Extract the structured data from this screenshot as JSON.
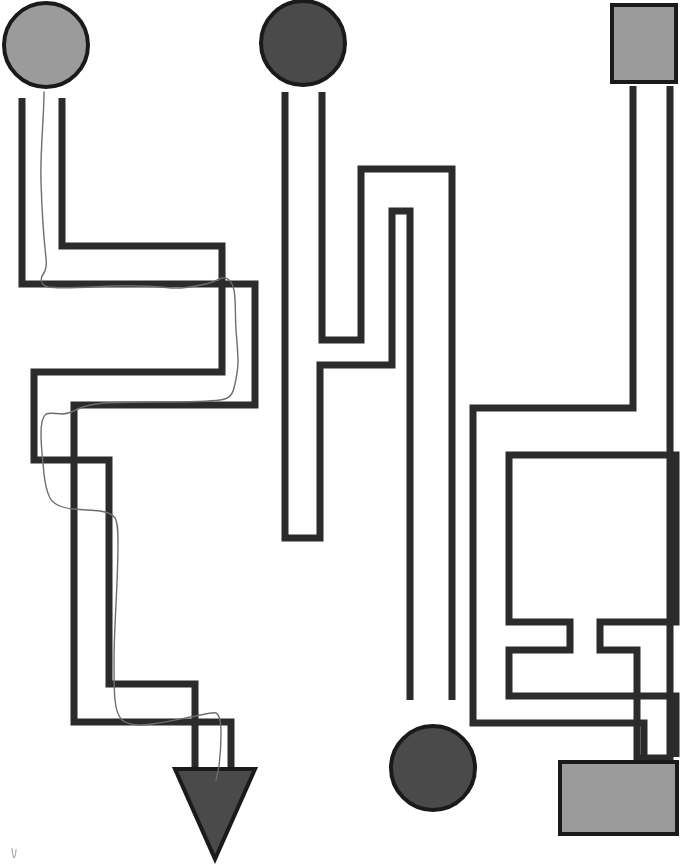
{
  "page": {
    "width": 684,
    "height": 867,
    "background_color": "#ffffff"
  },
  "colors": {
    "wall_stroke": "#2b2b2b",
    "wall_stroke_width": 7,
    "shape_outline": "#1a1a1a",
    "light_gray_fill": "#9b9b9b",
    "dark_gray_fill": "#4a4a4a",
    "pencil_line": "#6e6e6e",
    "paper": "#ffffff"
  },
  "shapes": [
    {
      "name": "start-circle-light",
      "kind": "circle",
      "fill_label": "light gray",
      "fill": "#9b9b9b",
      "cx": 46,
      "cy": 45,
      "r": 42,
      "role": "start marker for left maze"
    },
    {
      "name": "start-circle-dark-top",
      "kind": "circle",
      "fill_label": "dark gray",
      "fill": "#4a4a4a",
      "cx": 303,
      "cy": 43,
      "r": 42,
      "role": "start marker for middle maze"
    },
    {
      "name": "start-square-light",
      "kind": "square",
      "fill_label": "light gray",
      "fill": "#9b9b9b",
      "x": 612,
      "y": 5,
      "width": 64,
      "height": 77,
      "role": "start marker for right maze"
    },
    {
      "name": "end-triangle-dark",
      "kind": "triangle-down",
      "fill_label": "dark gray",
      "fill": "#4a4a4a",
      "x": 175,
      "y": 769,
      "width": 80,
      "height": 90,
      "role": "end marker for left maze"
    },
    {
      "name": "end-circle-dark-bottom",
      "kind": "circle",
      "fill_label": "dark gray",
      "fill": "#4a4a4a",
      "cx": 433,
      "cy": 768,
      "r": 42,
      "role": "end marker for middle maze"
    },
    {
      "name": "end-rectangle-light",
      "kind": "rectangle",
      "fill_label": "light gray",
      "fill": "#9b9b9b",
      "x": 560,
      "y": 762,
      "width": 117,
      "height": 72,
      "role": "end marker for right maze"
    }
  ],
  "mazes": [
    {
      "name": "left-maze",
      "start_shape": "start-circle-light",
      "end_shape": "end-triangle-dark",
      "solved": true,
      "walls": [
        "M22,98 L22,284 L255,284 L255,405 L74,405 L74,508 L74,722 L231,722 L231,775",
        "M62,98 L62,246 L222,246 L222,372 L34,372 L34,460 L109,460 L109,559 L109,684 L195,684 L195,775"
      ]
    },
    {
      "name": "middle-maze",
      "start_shape": "start-circle-dark-top",
      "end_shape": "end-circle-dark-bottom",
      "solved": false,
      "walls": [
        "M285,92 L285,538 L320,538 L320,365 L392,365 L392,211 L410,211 L410,700",
        "M322,92 L322,340 L361,340 L361,169 L452,169 L452,700"
      ]
    },
    {
      "name": "right-maze",
      "start_shape": "start-square-light",
      "end_shape": "end-rectangle-light",
      "solved": false,
      "walls": [
        "M633,86 L633,408 L473,408 L473,723 L644,723 L644,757",
        "M670,86 L670,758 L637,758 L637,650 L600,650 L600,622 L676,622 L676,455 L509,455 L509,622 L570,622 L570,650 L509,650 L509,696 L676,696 L676,757"
      ]
    }
  ],
  "solution": {
    "name": "pencil-solution-left-maze",
    "color": "#6e6e6e",
    "stroke_width": 1.4,
    "path": "M44,92 C44,120 40,150 41,182 C42,215 44,240 46,258 C47,268 45,272 42,276 C40,282 42,285 48,287 C60,289 88,287 112,286 C140,285 160,287 172,288 C184,289 196,286 206,284 C214,282 218,279 222,278 C228,277 232,281 234,290 C236,300 235,316 236,330 C237,342 238,352 238,362 C238,372 236,380 234,388 C232,396 228,399 220,400 C206,402 182,402 160,402 C140,402 120,402 104,403 C92,404 84,406 78,409 C72,412 68,414 62,414 C56,414 50,412 46,414 C42,417 41,424 41,434 C41,448 43,462 44,474 C45,484 47,492 50,498 C54,505 62,508 74,509 C84,510 92,510 100,511 C108,512 112,514 115,518 C118,523 118,532 118,544 C118,562 117,584 116,604 C115,624 114,644 114,662 C114,678 114,690 115,700 C116,710 118,716 122,720 C128,725 138,726 152,724 C168,722 184,718 196,716 C206,714 212,712 216,713 C220,715 221,722 221,734 C221,748 220,758 219,766 C218,772 217,776 216,780",
    "smudge_mark": "M12,848 C12,852 13,856 14,858 C15,857 16,853 16,849"
  }
}
